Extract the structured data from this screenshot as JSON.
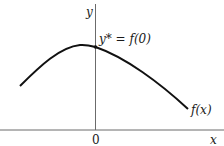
{
  "diagram": {
    "axes": {
      "x_label": "x",
      "y_label": "y",
      "origin_label": "0"
    },
    "curve": {
      "label": "f(x)",
      "shape": "concave, peaks just left of y-axis"
    },
    "annotation": {
      "label": "y* = f(0)"
    },
    "colors": {
      "axis": "#6b6b6b",
      "curve": "#111111",
      "text": "#1a1a1a",
      "background": "#ffffff"
    }
  }
}
